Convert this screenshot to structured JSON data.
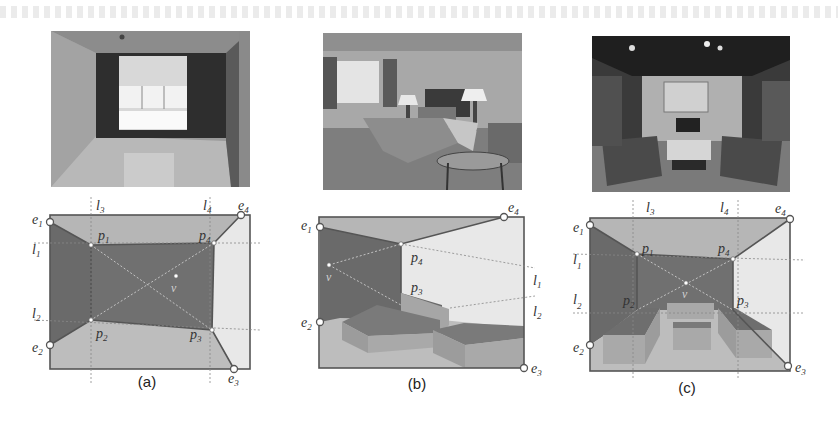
{
  "figure": {
    "panels": [
      {
        "id": "a",
        "caption": "(a)",
        "photo_description": "empty room with window on back wall, reflective floor",
        "labels": {
          "e1": "e",
          "e1_sub": "1",
          "e2": "e",
          "e2_sub": "2",
          "e3": "e",
          "e3_sub": "3",
          "e4": "e",
          "e4_sub": "4",
          "p1": "p",
          "p1_sub": "1",
          "p2": "p",
          "p2_sub": "2",
          "p3": "p",
          "p3_sub": "3",
          "p4": "p",
          "p4_sub": "4",
          "l1": "l",
          "l1_sub": "1",
          "l2": "l",
          "l2_sub": "2",
          "l3": "l",
          "l3_sub": "3",
          "l4": "l",
          "l4_sub": "4",
          "v": "v"
        }
      },
      {
        "id": "b",
        "caption": "(b)",
        "photo_description": "bedroom with bed, lamps, window and small table",
        "labels": {
          "e1": "e",
          "e1_sub": "1",
          "e2": "e",
          "e2_sub": "2",
          "e3": "e",
          "e3_sub": "3",
          "e4": "e",
          "e4_sub": "4",
          "p3": "p",
          "p3_sub": "3",
          "p4": "p",
          "p4_sub": "4",
          "l1": "l",
          "l1_sub": "1",
          "l2": "l",
          "l2_sub": "2",
          "v": "v"
        }
      },
      {
        "id": "c",
        "caption": "(c)",
        "photo_description": "living room with sofas, coffee table, fireplace and painting",
        "labels": {
          "e1": "e",
          "e1_sub": "1",
          "e2": "e",
          "e2_sub": "2",
          "e3": "e",
          "e3_sub": "3",
          "e4": "e",
          "e4_sub": "4",
          "p1": "p",
          "p1_sub": "1",
          "p2": "p",
          "p2_sub": "2",
          "p3": "p",
          "p3_sub": "3",
          "p4": "p",
          "p4_sub": "4",
          "l1": "l",
          "l1_sub": "1",
          "l2": "l",
          "l2_sub": "2",
          "l3": "l",
          "l3_sub": "3",
          "l4": "l",
          "l4_sub": "4",
          "v": "v"
        }
      }
    ],
    "colors": {
      "wall_dark": "#6e6e6e",
      "ceiling": "#b4b4b4",
      "floor": "#bdbdbd",
      "right_wall": "#e6e6e6",
      "box_face": "#a9a9a9",
      "box_top": "#7a7a7a",
      "outline": "#555555"
    }
  }
}
